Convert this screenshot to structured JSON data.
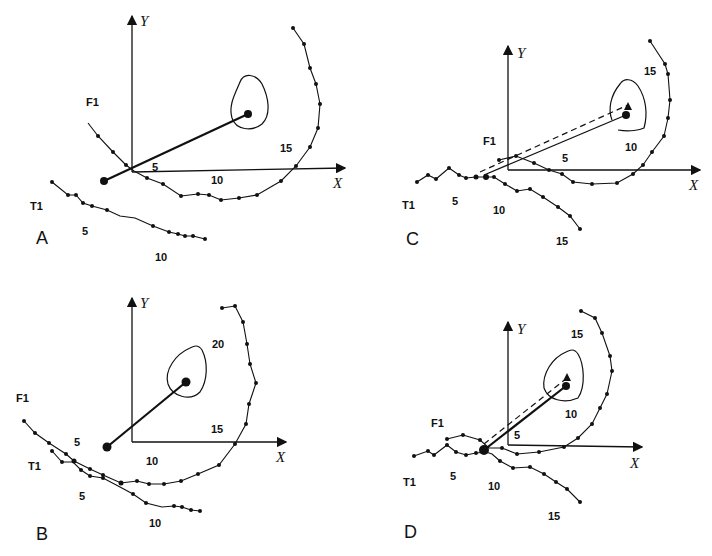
{
  "figure": {
    "panels": [
      {
        "id": "A",
        "label": "A",
        "axis_x": "X",
        "axis_y": "Y",
        "track_labels": [
          "F1",
          "T1"
        ],
        "markers": [
          "5",
          "10",
          "15",
          "5",
          "10"
        ]
      },
      {
        "id": "B",
        "label": "B",
        "axis_x": "X",
        "axis_y": "Y",
        "track_labels": [
          "F1",
          "T1"
        ],
        "markers": [
          "5",
          "10",
          "15",
          "20",
          "5",
          "10"
        ]
      },
      {
        "id": "C",
        "label": "C",
        "axis_x": "X",
        "axis_y": "Y",
        "track_labels": [
          "F1",
          "T1"
        ],
        "markers": [
          "5",
          "10",
          "15",
          "5",
          "10",
          "15"
        ]
      },
      {
        "id": "D",
        "label": "D",
        "axis_x": "X",
        "axis_y": "Y",
        "track_labels": [
          "F1",
          "T1"
        ],
        "markers": [
          "5",
          "10",
          "15",
          "5",
          "10",
          "15"
        ]
      }
    ]
  }
}
